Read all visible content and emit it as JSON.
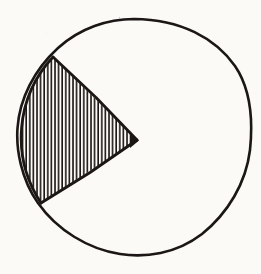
{
  "figure": {
    "kind": "hand-drawn-geometry-diagram",
    "title": "Circle with shaded sector",
    "background_color": "#fbfaf7",
    "ink_color": "#1a1613",
    "canvas": {
      "width": 261,
      "height": 274
    }
  },
  "chart_data": {
    "type": "pie",
    "subtitle": "",
    "xlabel": "",
    "ylabel": "",
    "categories": [
      "Shaded sector",
      "Unshaded remainder"
    ],
    "values": [
      78,
      282
    ],
    "value_unit": "degrees",
    "percentages": [
      21.7,
      78.3
    ],
    "legend": [],
    "legend_position": "none",
    "grid": false,
    "annotations": [],
    "tick_labels": [],
    "slice_styles": [
      {
        "name": "Shaded sector",
        "fill": "vertical-hatch",
        "hatch_color": "#1a1613",
        "hatch_spacing_px": 3.6,
        "hatch_line_width_px": 1.6,
        "outline_color": "#1a1613"
      },
      {
        "name": "Unshaded remainder",
        "fill": "none",
        "outline_color": "#1a1613"
      }
    ]
  },
  "geometry": {
    "circle": {
      "label": "circle outline",
      "center_x": 134,
      "center_y": 137,
      "radius": 118,
      "stroke_width": 2.6,
      "stroke_color": "#1a1613"
    },
    "sector": {
      "label": "hatched sector",
      "apex_x": 137,
      "apex_y": 140,
      "start_angle_deg": 135,
      "end_angle_deg": 213,
      "sweep_deg": 78,
      "upper_vertex_x": 53,
      "upper_vertex_y": 57,
      "lower_vertex_x": 41,
      "lower_vertex_y": 203,
      "radius_stroke_width": 2.8,
      "stroke_color": "#1a1613",
      "fill_pattern": "vertical-hatch"
    },
    "hatch": {
      "label": "vertical hatch lines",
      "orientation": "vertical",
      "spacing_px": 3.6,
      "line_width_px": 1.6,
      "color": "#1a1613",
      "line_count": 28
    }
  }
}
